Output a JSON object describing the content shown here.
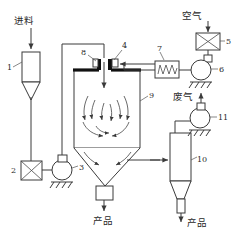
{
  "diagram": {
    "type": "process-flow-diagram",
    "width": 235,
    "height": 232,
    "background_color": "#ffffff",
    "line_color": "#3a3a3a",
    "thick_wall_color": "#111111"
  },
  "text_labels": {
    "feed_inlet": "进料",
    "air_inlet": "空气",
    "exhaust_gas": "废气",
    "product_chamber": "产品",
    "product_cyclone": "产品"
  },
  "item_numbers": {
    "n1": "1",
    "n2": "2",
    "n3": "3",
    "n4": "4",
    "n5": "5",
    "n6": "6",
    "n7": "7",
    "n8": "8",
    "n9": "9",
    "n10": "10",
    "n11": "11"
  },
  "equipment": [
    {
      "id": "1",
      "name": "feed-hopper",
      "shape": "tank-with-cone-bottom",
      "label": "1"
    },
    {
      "id": "2",
      "name": "feed-valve",
      "shape": "x-box-valve",
      "label": "2"
    },
    {
      "id": "3",
      "name": "feed-pump",
      "shape": "centrifugal-pump",
      "label": "3"
    },
    {
      "id": "4",
      "name": "atomizer-air-inlet",
      "shape": "nozzle-block",
      "label": "4"
    },
    {
      "id": "5",
      "name": "air-filter-valve",
      "shape": "x-box-valve",
      "label": "5"
    },
    {
      "id": "6",
      "name": "air-blower",
      "shape": "centrifugal-pump",
      "label": "6"
    },
    {
      "id": "7",
      "name": "air-heater",
      "shape": "resistor-coil-box",
      "label": "7"
    },
    {
      "id": "8",
      "name": "spray-nozzle",
      "shape": "nozzle-block",
      "label": "8"
    },
    {
      "id": "9",
      "name": "drying-chamber",
      "shape": "vessel-with-cone",
      "label": "9"
    },
    {
      "id": "10",
      "name": "cyclone-separator",
      "shape": "cyclone",
      "label": "10"
    },
    {
      "id": "11",
      "name": "exhaust-fan",
      "shape": "centrifugal-pump",
      "label": "11"
    }
  ],
  "flow_streams": [
    {
      "name": "feed-in",
      "from": "进料",
      "to": "1"
    },
    {
      "name": "hopper-to-valve",
      "from": "1",
      "to": "2"
    },
    {
      "name": "valve-to-pump",
      "from": "2",
      "to": "3"
    },
    {
      "name": "pump-to-nozzle",
      "from": "3",
      "to": "8"
    },
    {
      "name": "air-in",
      "from": "空气",
      "to": "5"
    },
    {
      "name": "valve-to-blower",
      "from": "5",
      "to": "6"
    },
    {
      "name": "blower-to-heater",
      "from": "6",
      "to": "7"
    },
    {
      "name": "heater-to-inlet",
      "from": "7",
      "to": "4"
    },
    {
      "name": "chamber-to-cyclone",
      "from": "9",
      "to": "10"
    },
    {
      "name": "cyclone-to-fan",
      "from": "10",
      "to": "11"
    },
    {
      "name": "fan-to-exhaust",
      "from": "11",
      "to": "废气"
    },
    {
      "name": "chamber-product",
      "from": "9",
      "to": "产品"
    },
    {
      "name": "cyclone-product",
      "from": "10",
      "to": "产品"
    }
  ]
}
